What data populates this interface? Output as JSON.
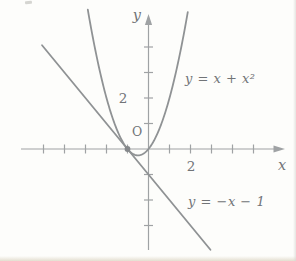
{
  "figure": {
    "background": "#fdfdfb",
    "curve_color": "#8f9294",
    "axis_color": "#9fa2a4",
    "text_color": "#717477",
    "point_color": "#85888b",
    "labels": {
      "y_axis": "y",
      "x_axis": "x",
      "origin": "O",
      "x_tick_2": "2",
      "y_tick_2": "2",
      "parabola": "y = x + x²",
      "line": "y = −x − 1"
    }
  },
  "chart_data": {
    "type": "line",
    "title": "",
    "xlabel": "x",
    "ylabel": "y",
    "xlim": [
      -6.1,
      6.5
    ],
    "ylim": [
      -4.0,
      5.3
    ],
    "grid": false,
    "legend": "inline-annotations",
    "x_ticks": [
      -5,
      -4,
      -3,
      -2,
      -1,
      1,
      2,
      3,
      4,
      5
    ],
    "y_ticks": [
      -3,
      -2,
      -1,
      1,
      2,
      3,
      4
    ],
    "labeled_ticks": {
      "x": [
        2
      ],
      "y": [
        2
      ]
    },
    "series": [
      {
        "name": "y = x + x²",
        "kind": "parabola",
        "coeffs": {
          "a": 1,
          "b": 1,
          "c": 0
        },
        "domain": [
          -2.89,
          1.89
        ],
        "key_points": [
          [
            -1,
            0
          ],
          [
            -0.5,
            -0.25
          ],
          [
            0,
            0
          ]
        ]
      },
      {
        "name": "y = −x − 1",
        "kind": "line",
        "slope": -1,
        "intercept": -1,
        "domain": [
          -5.07,
          2.95
        ],
        "key_points": [
          [
            -1,
            0
          ],
          [
            0,
            -1
          ]
        ]
      }
    ],
    "tangency_point": {
      "x": -1,
      "y": 0
    }
  }
}
